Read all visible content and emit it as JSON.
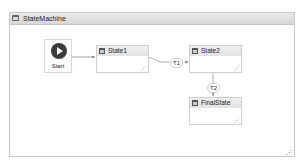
{
  "window": {
    "title": "StateMachine"
  },
  "start": {
    "label": "Start"
  },
  "states": [
    {
      "label": "State1"
    },
    {
      "label": "State2"
    },
    {
      "label": "FinalState"
    }
  ],
  "transitions": [
    {
      "label": "T1",
      "from": "State1",
      "to": "State2"
    },
    {
      "label": "T2",
      "from": "State2",
      "to": "FinalState"
    }
  ]
}
